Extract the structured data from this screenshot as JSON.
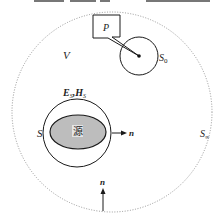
{
  "diagram": {
    "region_label": "V",
    "outer_surface_label": "S",
    "outer_surface_subscript": "∞",
    "observation_box_label": "P",
    "small_surface_label": "S",
    "small_surface_subscript": "0",
    "source_surface_label": "S",
    "field_label_e": "E",
    "field_label_e_sub": "S",
    "field_label_sep": ",",
    "field_label_h": "H",
    "field_label_h_sub": "S",
    "source_label": "源",
    "normal_right_label": "n",
    "normal_bottom_label": "n",
    "colors": {
      "stroke": "#1a1a1a",
      "dotted": "#888888",
      "source_fill": "#bdbdbd",
      "source_label_bg": "#e6e6e6"
    }
  }
}
